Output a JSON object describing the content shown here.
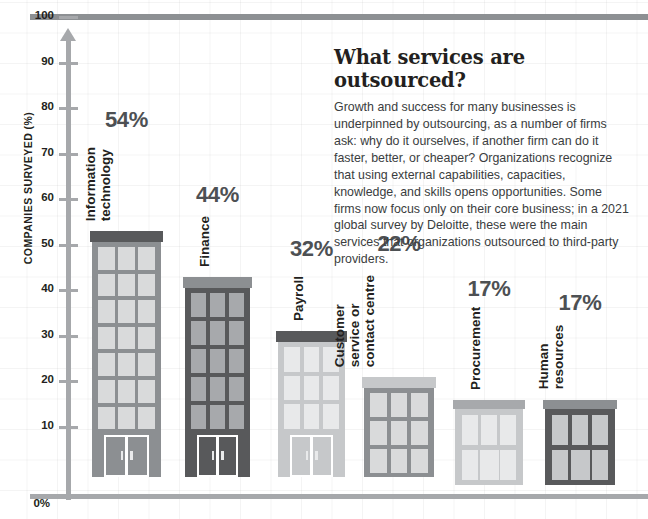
{
  "header": {
    "clipped_text": ""
  },
  "panel": {
    "title": "What services are outsourced?",
    "body": "Growth and success for many businesses is underpinned by outsourcing, as a number of firms ask: why do it ourselves, if another firm can do it faster, better, or cheaper? Organizations recognize that using external capabilities, capacities, knowledge, and skills opens opportunities. Some firms now focus only on their core business; in a 2021 global survey by Deloitte, these were the main services that organizations outsourced to third-party providers."
  },
  "axis": {
    "y_title": "COMPANIES SURVEYED (%)",
    "zero_label": "0%",
    "ticks": [
      "10",
      "20",
      "30",
      "40",
      "50",
      "60",
      "70",
      "80",
      "90",
      "100"
    ]
  },
  "colors": {
    "medium_gray": "#8c8f92",
    "dark_gray": "#58595b",
    "light_gray": "#c6c8ca",
    "window_light": "#d9dadb",
    "window_mid": "#a7a9ac",
    "window_pale": "#e8e9ea",
    "roof_dark": "#58595b",
    "roof_mid": "#8c8f92",
    "roof_light": "#c6c8ca",
    "axis_gray": "#a6a8ab",
    "value_label": "#4d5053",
    "rule_gray": "#8d9093"
  },
  "chart_data": {
    "type": "bar",
    "title": "What services are outsourced?",
    "xlabel": "",
    "ylabel": "COMPANIES SURVEYED (%)",
    "ylim": [
      0,
      100
    ],
    "grid": true,
    "legend": "none",
    "categories": [
      "Information technology",
      "Finance",
      "Payroll",
      "Customer service or contact centre",
      "Procurement",
      "Human resources"
    ],
    "values": [
      54,
      44,
      32,
      22,
      17,
      17
    ],
    "value_labels": [
      "54%",
      "44%",
      "32%",
      "22%",
      "17%",
      "17%"
    ],
    "bars": [
      {
        "category": "Information technology",
        "label_lines": [
          "Information",
          "technology"
        ],
        "value": 54,
        "value_label": "54%",
        "body_color": "#8c8f92",
        "roof_color": "#58595b",
        "window_color": "#d9dadb",
        "window_rows": 7,
        "has_door": true,
        "door_style": "full"
      },
      {
        "category": "Finance",
        "label_lines": [
          "Finance"
        ],
        "value": 44,
        "value_label": "44%",
        "body_color": "#58595b",
        "roof_color": "#8c8f92",
        "window_color": "#a7a9ac",
        "window_rows": 5,
        "has_door": true,
        "door_style": "full"
      },
      {
        "category": "Payroll",
        "label_lines": [
          "Payroll"
        ],
        "value": 32,
        "value_label": "32%",
        "body_color": "#c6c8ca",
        "roof_color": "#58595b",
        "window_color": "#e8e9ea",
        "window_rows": 3,
        "has_door": true,
        "door_style": "full"
      },
      {
        "category": "Customer service or contact centre",
        "label_lines": [
          "Customer",
          "service or",
          "contact centre"
        ],
        "value": 22,
        "value_label": "22%",
        "body_color": "#8c8f92",
        "roof_color": "#c6c8ca",
        "window_color": "#d9dadb",
        "window_rows": 3,
        "has_door": false,
        "door_style": "none"
      },
      {
        "category": "Procurement",
        "label_lines": [
          "Procurement"
        ],
        "value": 17,
        "value_label": "17%",
        "body_color": "#c6c8ca",
        "roof_color": "#a7a9ac",
        "window_color": "#e8e9ea",
        "window_rows": 2,
        "has_door": true,
        "door_style": "center"
      },
      {
        "category": "Human resources",
        "label_lines": [
          "Human",
          "resources"
        ],
        "value": 17,
        "value_label": "17%",
        "body_color": "#58595b",
        "roof_color": "#8c8f92",
        "window_color": "#c6c8ca",
        "window_rows": 2,
        "has_door": true,
        "door_style": "center"
      }
    ]
  }
}
